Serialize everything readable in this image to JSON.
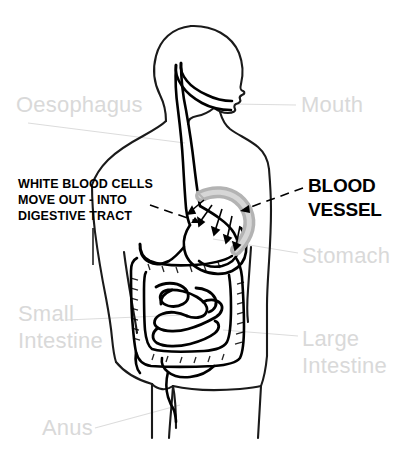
{
  "diagram": {
    "background_color": "#ffffff",
    "width": 418,
    "height": 455,
    "colors": {
      "body_outline": "#1a1a1a",
      "organ_outline": "#000000",
      "blood_vessel": "#b3b3b3",
      "organ_label_text": "#d9d9d9",
      "callout_text": "#000000",
      "leader_line_gray": "#dcdcdc",
      "leader_line_black": "#000000"
    }
  },
  "organ_labels": {
    "oesophagus": "Oesophagus",
    "mouth": "Mouth",
    "stomach": "Stomach",
    "small_intestine": "Small\nIntestine",
    "large_intestine": "Large\nIntestine",
    "anus": "Anus"
  },
  "callouts": {
    "white_blood_cells": "WHITE BLOOD CELLS\nMOVE OUT - INTO\nDIGESTIVE TRACT",
    "blood_vessel": "BLOOD\nVESSEL"
  },
  "figure_parts": [
    "head-profile",
    "torso-outline",
    "left-arm",
    "right-arm",
    "legs",
    "oesophagus-tube",
    "stomach",
    "small-intestine-coils",
    "large-intestine",
    "rectum-anus",
    "blood-vessel-tube",
    "white-blood-cell-arrows"
  ]
}
